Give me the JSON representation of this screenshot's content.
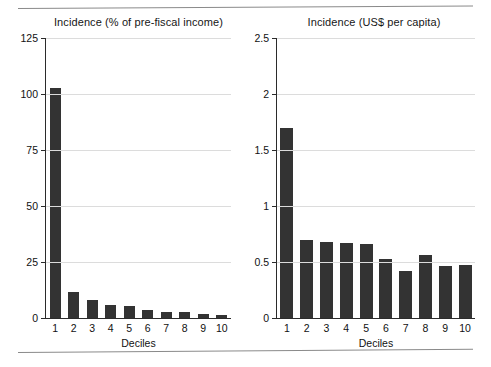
{
  "chart_data": [
    {
      "type": "bar",
      "title": "Incidence (% of pre-fiscal income)",
      "xlabel": "Deciles",
      "ylabel": "",
      "categories": [
        "1",
        "2",
        "3",
        "4",
        "5",
        "6",
        "7",
        "8",
        "9",
        "10"
      ],
      "values": [
        102.5,
        11.5,
        8.0,
        6.0,
        5.2,
        3.4,
        2.5,
        2.9,
        2.0,
        1.4
      ],
      "ylim": [
        0,
        125
      ],
      "yticks": [
        0,
        25,
        50,
        75,
        100,
        125
      ],
      "ytick_labels": [
        "0",
        "25",
        "50",
        "75",
        "100",
        "125"
      ],
      "grid": true,
      "legend": "none",
      "bar_color": "#333333"
    },
    {
      "type": "bar",
      "title": "Incidence (US$ per capita)",
      "xlabel": "Deciles",
      "ylabel": "",
      "categories": [
        "1",
        "2",
        "3",
        "4",
        "5",
        "6",
        "7",
        "8",
        "9",
        "10"
      ],
      "values": [
        1.7,
        0.7,
        0.68,
        0.67,
        0.66,
        0.53,
        0.42,
        0.56,
        0.46,
        0.47
      ],
      "ylim": [
        0,
        2.5
      ],
      "yticks": [
        0,
        0.5,
        1,
        1.5,
        2,
        2.5
      ],
      "ytick_labels": [
        "0",
        "0.5",
        "1",
        "1.5",
        "2",
        "2.5"
      ],
      "grid": true,
      "legend": "none",
      "bar_color": "#333333"
    }
  ],
  "figure": {
    "rule_color": "#8a8a8a",
    "background": "#ffffff"
  }
}
